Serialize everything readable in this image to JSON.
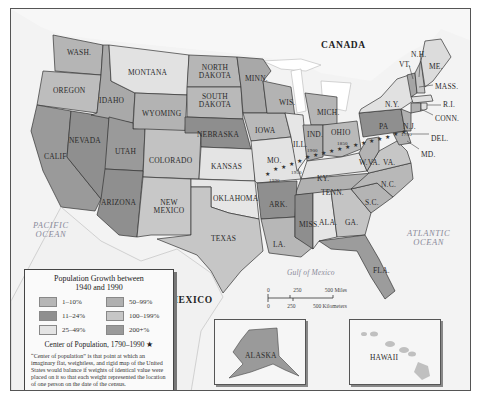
{
  "map": {
    "labels": {
      "canada": "CANADA",
      "mexico": "MEXICO",
      "pacific_ocean": "PACIFIC\nOCEAN",
      "atlantic_ocean": "ATLANTIC\nOCEAN",
      "gulf_of_mexico": "Gulf of Mexico"
    },
    "states": [
      {
        "name": "WASH.",
        "category": "50-99%",
        "fill": "#b5b5b5"
      },
      {
        "name": "OREGON",
        "category": "50-99%",
        "fill": "#bdbdbd"
      },
      {
        "name": "CALIF",
        "category": "100-199%",
        "fill": "#9a9a9a"
      },
      {
        "name": "NEVADA",
        "category": "200+%",
        "fill": "#8f8f8f"
      },
      {
        "name": "IDAHO",
        "category": "50-99%",
        "fill": "#a9a9a9"
      },
      {
        "name": "MONTANA",
        "category": "25-49%",
        "fill": "#e2e2e2"
      },
      {
        "name": "WYOMING",
        "category": "50-99%",
        "fill": "#b3b3b3"
      },
      {
        "name": "UTAH",
        "category": "200+%",
        "fill": "#9a9a9a"
      },
      {
        "name": "COLORADO",
        "category": "100-199%",
        "fill": "#c2c2c2"
      },
      {
        "name": "ARIZONA",
        "category": "200+%",
        "fill": "#8f8f8f"
      },
      {
        "name": "NEW MEXICO",
        "category": "100-199%",
        "fill": "#c8c8c8"
      },
      {
        "name": "NORTH DAKOTA",
        "category": "1-10%",
        "fill": "#b6b6b6"
      },
      {
        "name": "SOUTH DAKOTA",
        "category": "1-10%",
        "fill": "#b9b9b9"
      },
      {
        "name": "NEBRASKA",
        "category": "11-24%",
        "fill": "#8e8e8e"
      },
      {
        "name": "KANSAS",
        "category": "25-49%",
        "fill": "#e4e4e4"
      },
      {
        "name": "OKLAHOMA",
        "category": "25-49%",
        "fill": "#e6e6e6"
      },
      {
        "name": "TEXAS",
        "category": "100-199%",
        "fill": "#c6c6c6"
      },
      {
        "name": "MINN.",
        "category": "11-24%",
        "fill": "#a8a8a8"
      },
      {
        "name": "IOWA",
        "category": "1-10%",
        "fill": "#b9b9b9"
      },
      {
        "name": "MO.",
        "category": "25-49%",
        "fill": "#e3e3e3"
      },
      {
        "name": "ARK.",
        "category": "11-24%",
        "fill": "#8f8f8f"
      },
      {
        "name": "LA.",
        "category": "50-99%",
        "fill": "#b7b7b7"
      },
      {
        "name": "WIS.",
        "category": "50-99%",
        "fill": "#b3b3b3"
      },
      {
        "name": "ILL.",
        "category": "25-49%",
        "fill": "#e6e6e6"
      },
      {
        "name": "MICH.",
        "category": "50-99%",
        "fill": "#b5b5b5"
      },
      {
        "name": "IND.",
        "category": "50-99%",
        "fill": "#aeaeae"
      },
      {
        "name": "OHIO",
        "category": "50-99%",
        "fill": "#b9b9b9"
      },
      {
        "name": "KY.",
        "category": "25-49%",
        "fill": "#e3e3e3"
      },
      {
        "name": "TENN.",
        "category": "50-99%",
        "fill": "#b1b1b1"
      },
      {
        "name": "MISS.",
        "category": "11-24%",
        "fill": "#8e8e8e"
      },
      {
        "name": "ALA.",
        "category": "25-49%",
        "fill": "#e5e5e5"
      },
      {
        "name": "GA.",
        "category": "100-199%",
        "fill": "#c4c4c4"
      },
      {
        "name": "FLA.",
        "category": "200+%",
        "fill": "#9c9c9c"
      },
      {
        "name": "S.C.",
        "category": "50-99%",
        "fill": "#b4b4b4"
      },
      {
        "name": "N.C.",
        "category": "50-99%",
        "fill": "#b8b8b8"
      },
      {
        "name": "VA.",
        "category": "100-199%",
        "fill": "#c6c6c6"
      },
      {
        "name": "W.VA.",
        "category": "1-10%",
        "fill": "#b3b3b3"
      },
      {
        "name": "PA",
        "category": "11-24%",
        "fill": "#8f8f8f"
      },
      {
        "name": "N.Y.",
        "category": "25-49%",
        "fill": "#e1e1e1"
      },
      {
        "name": "N.J.",
        "category": "50-99%",
        "fill": "#b0b0b0"
      },
      {
        "name": "VT.",
        "category": "50-99%",
        "fill": "#a5a5a5"
      },
      {
        "name": "N.H.",
        "category": "100-199%",
        "fill": "#c5c5c5"
      },
      {
        "name": "ME.",
        "category": "25-49%",
        "fill": "#dcdcdc"
      },
      {
        "name": "MASS.",
        "category": "25-49%",
        "fill": "#e0e0e0"
      },
      {
        "name": "R.I.",
        "category": "25-49%",
        "fill": "#e0e0e0"
      },
      {
        "name": "CONN.",
        "category": "50-99%",
        "fill": "#b0b0b0"
      },
      {
        "name": "DEL.",
        "category": "50-99%",
        "fill": "#b0b0b0"
      },
      {
        "name": "MD.",
        "category": "50-99%",
        "fill": "#b0b0b0"
      },
      {
        "name": "ALASKA",
        "category": "200+%",
        "fill": "#9a9a9a"
      },
      {
        "name": "HAWAII",
        "category": "100-199%",
        "fill": "#c0c0c0"
      }
    ],
    "center_of_population_years": [
      "1790",
      "1850",
      "1900",
      "1950",
      "1990"
    ]
  },
  "legend": {
    "title": "Population Growth between\n1940 and 1990",
    "items": [
      {
        "label": "1–10%",
        "color": "#b6b6b6"
      },
      {
        "label": "50–99%",
        "color": "#b0b0b0"
      },
      {
        "label": "11–24%",
        "color": "#8f8f8f"
      },
      {
        "label": "100–199%",
        "color": "#c6c6c6"
      },
      {
        "label": "25–49%",
        "color": "#e4e4e4"
      },
      {
        "label": "200+%",
        "color": "#9a9a9a"
      }
    ],
    "center_label": "Center of Population, 1790–1990 ★",
    "note": "“Center of population” is that point at which an imaginary flat, weightless, and rigid map of the United States would balance if weights of identical value were placed on it so that each weight represented the location of one person on the date of the census."
  },
  "scale": {
    "miles_ticks": [
      "0",
      "250",
      "500 Miles"
    ],
    "km_ticks": [
      "0",
      "250",
      "500 Kilometers"
    ]
  },
  "insets": {
    "alaska": "ALASKA",
    "hawaii": "HAWAII"
  }
}
